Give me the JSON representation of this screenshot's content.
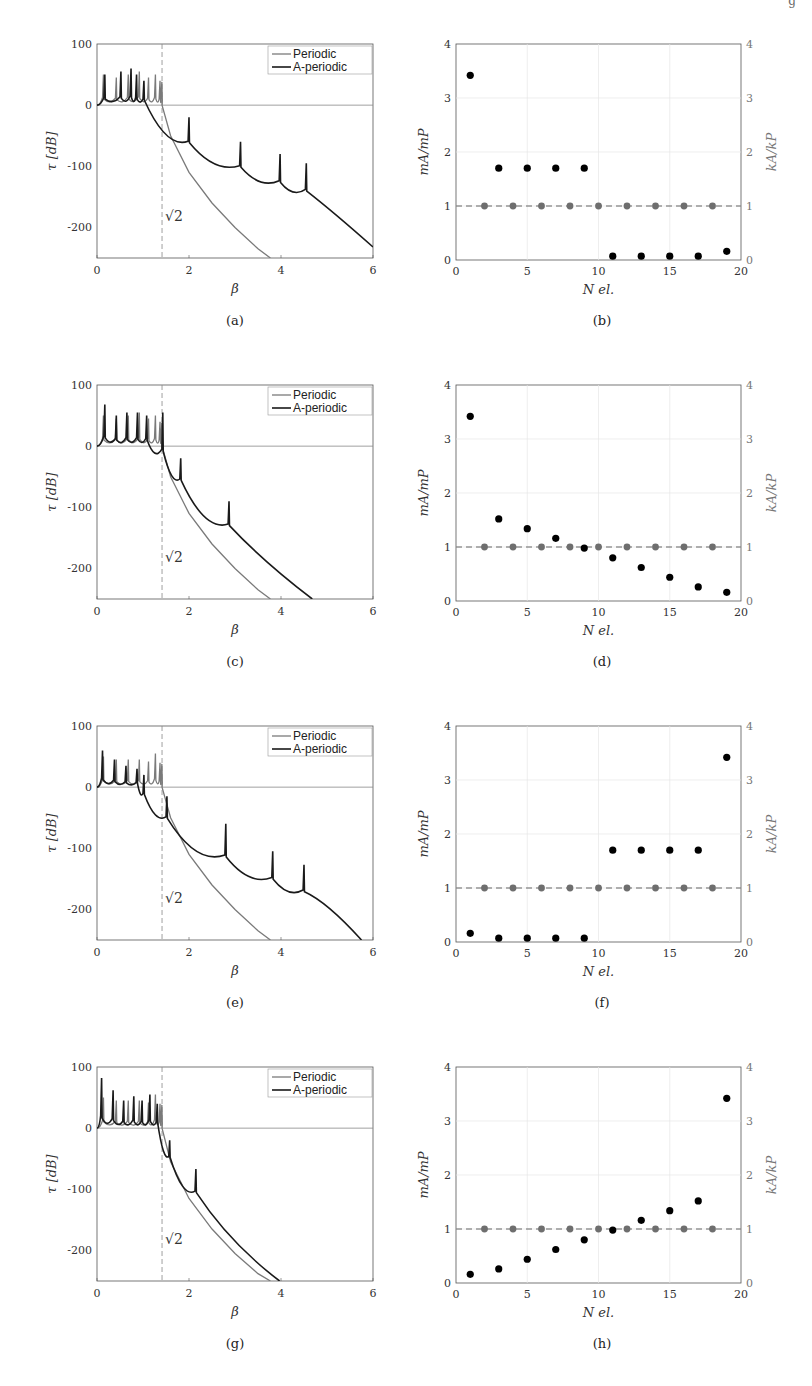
{
  "page": {
    "header_fragment": "g",
    "captions": [
      "(a)",
      "(b)",
      "(c)",
      "(d)",
      "(e)",
      "(f)",
      "(g)",
      "(h)"
    ]
  },
  "colors": {
    "periodic": "#7a7a7a",
    "aperiodic": "#1a1a1a",
    "mass_points": "#000000",
    "stiffness_points": "#6e6e6e",
    "grid": "#e6e6e6",
    "axis": "#555555"
  },
  "chart_data": [
    {
      "id": "a",
      "type": "line",
      "title": "",
      "xlabel": "β",
      "ylabel": "τ [dB]",
      "xlim": [
        0,
        6
      ],
      "ylim": [
        -250,
        100
      ],
      "xticks": [
        0,
        2,
        4,
        6
      ],
      "yticks": [
        100,
        0,
        -100,
        -200
      ],
      "annotation": "√2",
      "vline_x": 1.414,
      "legend": [
        "Periodic",
        "A-periodic"
      ],
      "legend_position": "upper right",
      "series": [
        {
          "name": "Periodic",
          "peaks": [
            0.14,
            0.42,
            0.68,
            0.92,
            1.12,
            1.27,
            1.37,
            1.41
          ],
          "peak_heights": [
            50,
            45,
            50,
            55,
            45,
            50,
            40,
            38
          ],
          "decay": [
            [
              1.414,
              0
            ],
            [
              1.6,
              -50
            ],
            [
              2,
              -110
            ],
            [
              2.5,
              -160
            ],
            [
              3,
              -200
            ],
            [
              3.5,
              -235
            ],
            [
              3.77,
              -250
            ]
          ]
        },
        {
          "name": "A-periodic",
          "peaks": [
            0.17,
            0.52,
            0.74,
            0.86,
            1.02,
            2.0,
            3.12,
            3.98,
            4.55
          ],
          "peak_heights": [
            50,
            55,
            60,
            50,
            40,
            -20,
            -60,
            -80,
            -95
          ],
          "troughs": [
            [
              1.9,
              -72
            ],
            [
              3.05,
              -112
            ],
            [
              3.9,
              -138
            ],
            [
              4.48,
              -152
            ]
          ],
          "end": [
            6,
            -232
          ]
        }
      ]
    },
    {
      "id": "b",
      "type": "scatter",
      "xlabel": "N_el.",
      "ylabel": "m_A/m_P",
      "ylabel_right": "k_A/k_P",
      "xlim": [
        0,
        20
      ],
      "ylim": [
        0,
        4
      ],
      "xticks": [
        0,
        5,
        10,
        15,
        20
      ],
      "yticks": [
        0,
        1,
        2,
        3,
        4
      ],
      "series": [
        {
          "name": "m_A/m_P",
          "x": [
            1,
            3,
            5,
            7,
            9,
            11,
            13,
            15,
            17,
            19
          ],
          "y": [
            3.42,
            1.7,
            1.7,
            1.7,
            1.7,
            0.07,
            0.07,
            0.07,
            0.07,
            0.16
          ]
        },
        {
          "name": "k_A/k_P",
          "x": [
            2,
            4,
            6,
            8,
            10,
            12,
            14,
            16,
            18
          ],
          "y": [
            1,
            1,
            1,
            1,
            1,
            1,
            1,
            1,
            1
          ]
        }
      ],
      "hline_y": 1
    },
    {
      "id": "c",
      "type": "line",
      "xlabel": "β",
      "ylabel": "τ [dB]",
      "xlim": [
        0,
        6
      ],
      "ylim": [
        -250,
        100
      ],
      "xticks": [
        0,
        2,
        4,
        6
      ],
      "yticks": [
        100,
        0,
        -100,
        -200
      ],
      "annotation": "√2",
      "vline_x": 1.414,
      "legend": [
        "Periodic",
        "A-periodic"
      ],
      "series": [
        {
          "name": "Periodic",
          "peaks": [
            0.14,
            0.42,
            0.68,
            0.92,
            1.12,
            1.27,
            1.37,
            1.41
          ],
          "peak_heights": [
            50,
            45,
            50,
            55,
            45,
            50,
            40,
            38
          ],
          "decay": [
            [
              1.414,
              0
            ],
            [
              1.6,
              -50
            ],
            [
              2,
              -110
            ],
            [
              2.5,
              -160
            ],
            [
              3,
              -200
            ],
            [
              3.5,
              -235
            ],
            [
              3.77,
              -250
            ]
          ]
        },
        {
          "name": "A-periodic",
          "peaks": [
            0.17,
            0.42,
            0.65,
            0.88,
            1.08,
            1.43,
            1.82,
            2.87
          ],
          "peak_heights": [
            68,
            50,
            55,
            55,
            50,
            55,
            -20,
            -90
          ],
          "troughs": [
            [
              1.35,
              -25
            ],
            [
              1.75,
              -65
            ],
            [
              2.75,
              -140
            ]
          ],
          "end": [
            4.68,
            -250
          ]
        }
      ]
    },
    {
      "id": "d",
      "type": "scatter",
      "xlabel": "N_el.",
      "ylabel": "m_A/m_P",
      "ylabel_right": "k_A/k_P",
      "xlim": [
        0,
        20
      ],
      "ylim": [
        0,
        4
      ],
      "xticks": [
        0,
        5,
        10,
        15,
        20
      ],
      "yticks": [
        0,
        1,
        2,
        3,
        4
      ],
      "series": [
        {
          "name": "m_A/m_P",
          "x": [
            1,
            3,
            5,
            7,
            9,
            11,
            13,
            15,
            17,
            19
          ],
          "y": [
            3.42,
            1.52,
            1.34,
            1.16,
            0.98,
            0.8,
            0.62,
            0.44,
            0.26,
            0.16
          ]
        },
        {
          "name": "k_A/k_P",
          "x": [
            2,
            4,
            6,
            8,
            10,
            12,
            14,
            16,
            18
          ],
          "y": [
            1,
            1,
            1,
            1,
            1,
            1,
            1,
            1,
            1
          ]
        }
      ],
      "hline_y": 1
    },
    {
      "id": "e",
      "type": "line",
      "xlabel": "β",
      "ylabel": "τ [dB]",
      "xlim": [
        0,
        6
      ],
      "ylim": [
        -250,
        100
      ],
      "xticks": [
        0,
        2,
        4,
        6
      ],
      "yticks": [
        100,
        0,
        -100,
        -200
      ],
      "annotation": "√2",
      "vline_x": 1.414,
      "legend": [
        "Periodic",
        "A-periodic"
      ],
      "series": [
        {
          "name": "Periodic",
          "peaks": [
            0.14,
            0.42,
            0.68,
            0.92,
            1.12,
            1.27,
            1.37,
            1.41
          ],
          "peak_heights": [
            50,
            45,
            45,
            45,
            42,
            55,
            40,
            38
          ],
          "decay": [
            [
              1.414,
              0
            ],
            [
              1.6,
              -50
            ],
            [
              2,
              -110
            ],
            [
              2.5,
              -160
            ],
            [
              3,
              -200
            ],
            [
              3.5,
              -235
            ],
            [
              3.77,
              -250
            ]
          ]
        },
        {
          "name": "A-periodic",
          "peaks": [
            0.12,
            0.38,
            0.63,
            0.87,
            1.02,
            1.52,
            2.8,
            3.82,
            4.5
          ],
          "peak_heights": [
            60,
            45,
            35,
            30,
            20,
            -15,
            -60,
            -105,
            -127
          ],
          "troughs": [
            [
              1.4,
              -60
            ],
            [
              2.7,
              -128
            ],
            [
              3.72,
              -162
            ],
            [
              4.4,
              -182
            ]
          ],
          "end": [
            5.75,
            -250
          ]
        }
      ]
    },
    {
      "id": "f",
      "type": "scatter",
      "xlabel": "N_el.",
      "ylabel": "m_A/m_P",
      "ylabel_right": "k_A/k_P",
      "xlim": [
        0,
        20
      ],
      "ylim": [
        0,
        4
      ],
      "xticks": [
        0,
        5,
        10,
        15,
        20
      ],
      "yticks": [
        0,
        1,
        2,
        3,
        4
      ],
      "series": [
        {
          "name": "m_A/m_P",
          "x": [
            1,
            3,
            5,
            7,
            9,
            11,
            13,
            15,
            17,
            19
          ],
          "y": [
            0.16,
            0.07,
            0.07,
            0.07,
            0.07,
            1.7,
            1.7,
            1.7,
            1.7,
            3.42
          ]
        },
        {
          "name": "k_A/k_P",
          "x": [
            2,
            4,
            6,
            8,
            10,
            12,
            14,
            16,
            18
          ],
          "y": [
            1,
            1,
            1,
            1,
            1,
            1,
            1,
            1,
            1
          ]
        }
      ],
      "hline_y": 1
    },
    {
      "id": "g",
      "type": "line",
      "xlabel": "β",
      "ylabel": "τ [dB]",
      "xlim": [
        0,
        6
      ],
      "ylim": [
        -250,
        100
      ],
      "xticks": [
        0,
        2,
        4,
        6
      ],
      "yticks": [
        100,
        0,
        -100,
        -200
      ],
      "annotation": "√2",
      "vline_x": 1.414,
      "legend": [
        "Periodic",
        "A-periodic"
      ],
      "series": [
        {
          "name": "Periodic",
          "peaks": [
            0.14,
            0.42,
            0.68,
            0.92,
            1.12,
            1.27,
            1.37,
            1.41
          ],
          "peak_heights": [
            50,
            45,
            45,
            45,
            42,
            55,
            40,
            38
          ],
          "decay": [
            [
              1.414,
              0
            ],
            [
              1.6,
              -55
            ],
            [
              2,
              -115
            ],
            [
              2.5,
              -165
            ],
            [
              3,
              -205
            ],
            [
              3.5,
              -238
            ],
            [
              3.77,
              -250
            ]
          ]
        },
        {
          "name": "A-periodic",
          "peaks": [
            0.1,
            0.35,
            0.58,
            0.8,
            0.98,
            1.15,
            1.31,
            1.58,
            2.15
          ],
          "peak_heights": [
            82,
            62,
            45,
            52,
            45,
            55,
            40,
            -20,
            -67
          ],
          "troughs": [
            [
              1.5,
              -55
            ],
            [
              2.1,
              -115
            ]
          ],
          "end": [
            3.97,
            -250
          ]
        }
      ]
    },
    {
      "id": "h",
      "type": "scatter",
      "xlabel": "N_el.",
      "ylabel": "m_A/m_P",
      "ylabel_right": "k_A/k_P",
      "xlim": [
        0,
        20
      ],
      "ylim": [
        0,
        4
      ],
      "xticks": [
        0,
        5,
        10,
        15,
        20
      ],
      "yticks": [
        0,
        1,
        2,
        3,
        4
      ],
      "series": [
        {
          "name": "m_A/m_P",
          "x": [
            1,
            3,
            5,
            7,
            9,
            11,
            13,
            15,
            17,
            19
          ],
          "y": [
            0.16,
            0.26,
            0.44,
            0.62,
            0.8,
            0.98,
            1.16,
            1.34,
            1.52,
            3.42
          ]
        },
        {
          "name": "k_A/k_P",
          "x": [
            2,
            4,
            6,
            8,
            10,
            12,
            14,
            16,
            18
          ],
          "y": [
            1,
            1,
            1,
            1,
            1,
            1,
            1,
            1,
            1
          ]
        }
      ],
      "hline_y": 1
    }
  ]
}
